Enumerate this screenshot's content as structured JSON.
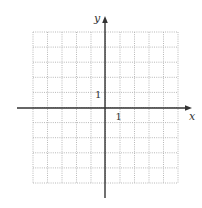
{
  "diagram": {
    "type": "coordinate-plane",
    "grid": {
      "columns": 10,
      "rows": 10,
      "left": 33,
      "top": 32,
      "right": 178,
      "bottom": 183,
      "line_style": "dotted",
      "line_color": "#b8b8b8"
    },
    "axes": {
      "color": "#333333",
      "x_axis": {
        "y": 108,
        "x_start": 17,
        "x_end": 192,
        "label": "x"
      },
      "y_axis": {
        "x": 105,
        "y_start": 16,
        "y_end": 198,
        "label": "y"
      }
    },
    "tick_labels": {
      "x_unit": "1",
      "y_unit": "1"
    }
  }
}
